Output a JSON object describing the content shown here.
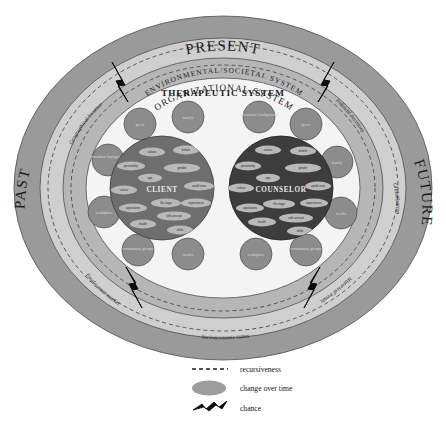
{
  "figure": {
    "title_visible": false,
    "eras": {
      "present": "PRESENT",
      "past": "PAST",
      "future": "FUTURE"
    },
    "systems": {
      "environmental": "ENVIRONMENTAL/SOCIETAL  SYSTEM",
      "organizational": "ORGANIZATIONAL SYSTEM",
      "therapeutic": "THERAPEUTIC SYSTEM"
    },
    "contextual_factors": [
      {
        "id": "geographical-location",
        "label": "Geographical location"
      },
      {
        "id": "political-decisions",
        "label": "Political decisions"
      },
      {
        "id": "globalization",
        "label": "Globalization"
      },
      {
        "id": "historical-trends",
        "label": "Historical trends"
      },
      {
        "id": "socioeconomic-status",
        "label": "Socioeconomic status"
      },
      {
        "id": "employment-market",
        "label": "Employment market"
      }
    ],
    "actors": [
      {
        "id": "client",
        "label": "CLIENT"
      },
      {
        "id": "counselor",
        "label": "COUNSELOR"
      }
    ],
    "client_nodes": [
      "peers",
      "family",
      "education/ background",
      "workplace",
      "community groups",
      "media"
    ],
    "counselor_nodes": [
      "education/ background",
      "peers",
      "family",
      "media",
      "community groups",
      "workplace"
    ],
    "client_attributes": [
      "values",
      "beliefs",
      "personality",
      "gender",
      "age",
      "culture",
      "world view",
      "life stage",
      "experiences",
      "aspirations",
      "self-concept",
      "health",
      "skills"
    ],
    "counselor_attributes": [
      "values",
      "beliefs",
      "personality",
      "gender",
      "age",
      "culture",
      "world view",
      "life stage",
      "experiences",
      "aspirations",
      "self-concept",
      "health",
      "skills"
    ],
    "legend": [
      {
        "id": "recursiveness",
        "label": "recursiveness",
        "symbol": "dashed-line-icon"
      },
      {
        "id": "change-over-time",
        "label": "change over time",
        "symbol": "ellipse-icon"
      },
      {
        "id": "chance",
        "label": "chance",
        "symbol": "zigzag-icon"
      }
    ],
    "colors": {
      "outer_ring": "#9a9a9a",
      "mid_ring": "#c8c8c8",
      "inner_ring": "#b4b4b4",
      "core_field": "#f2f2f2",
      "client_disc": "#6e6e6e",
      "counselor_disc": "#3d3d3d",
      "node_disc": "#8c8c8c",
      "oval_fill": "#b9b9b9",
      "legend_ellipse": "#9d9d9d",
      "chance_stroke": "#0b0b0b",
      "text": "#1a1a1a"
    }
  }
}
